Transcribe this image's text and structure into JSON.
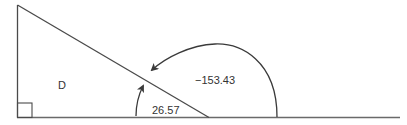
{
  "diagram": {
    "type": "right-triangle-angle-diagram",
    "region_label": "D",
    "angle_small": {
      "label": "26.57",
      "direction": "counterclockwise"
    },
    "angle_large": {
      "label": "−153.43",
      "direction": "clockwise"
    },
    "right_angle_marker": true,
    "colors": {
      "stroke": "#4a4a4a",
      "text": "#333333",
      "background": "#ffffff"
    }
  }
}
